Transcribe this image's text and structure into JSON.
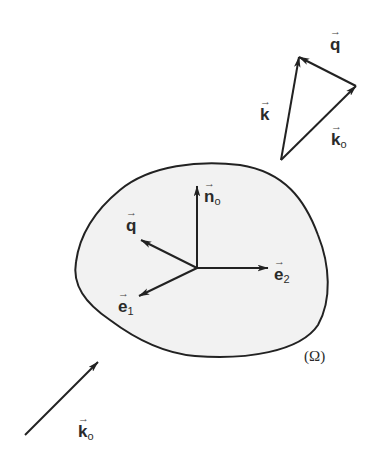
{
  "figure": {
    "region_label": "(Ω)",
    "colors": {
      "stroke": "#222222",
      "fill": "#f2f2f2",
      "text": "#2a2a2a"
    },
    "domain_shape": {
      "name": "Ω",
      "fill": "#f2f2f2"
    },
    "local_frame": {
      "origin": [
        197,
        268
      ],
      "vectors": [
        {
          "id": "n0",
          "symbol": "n",
          "subscript": "o",
          "to": [
            197,
            186
          ]
        },
        {
          "id": "e2",
          "symbol": "e",
          "subscript": "2",
          "to": [
            268,
            268
          ]
        },
        {
          "id": "e1",
          "symbol": "e",
          "subscript": "1",
          "to": [
            139,
            296
          ]
        },
        {
          "id": "q",
          "symbol": "q",
          "subscript": "",
          "to": [
            141,
            240
          ]
        }
      ]
    },
    "wave_triangle": {
      "vertices": {
        "base": [
          281,
          160
        ],
        "top": [
          299,
          57
        ],
        "right": [
          356,
          86
        ]
      },
      "vectors": [
        {
          "id": "k",
          "symbol": "k",
          "subscript": "",
          "from": "base",
          "to": "top"
        },
        {
          "id": "k0",
          "symbol": "k",
          "subscript": "o",
          "from": "base",
          "to": "right"
        },
        {
          "id": "q",
          "symbol": "q",
          "subscript": "",
          "from": "right",
          "to": "top"
        }
      ]
    },
    "incident_vector": {
      "symbol": "k",
      "subscript": "o",
      "from": [
        25,
        435
      ],
      "to": [
        98,
        362
      ]
    }
  },
  "labels": {
    "n0": {
      "symbol": "n",
      "sub": "o"
    },
    "e2": {
      "symbol": "e",
      "sub": "2"
    },
    "e1": {
      "symbol": "e",
      "sub": "1"
    },
    "q_local": {
      "symbol": "q",
      "sub": ""
    },
    "tri_q": {
      "symbol": "q",
      "sub": ""
    },
    "tri_k": {
      "symbol": "k",
      "sub": ""
    },
    "tri_k0": {
      "symbol": "k",
      "sub": "o"
    },
    "inc_k0": {
      "symbol": "k",
      "sub": "o"
    },
    "omega": "(Ω)"
  }
}
